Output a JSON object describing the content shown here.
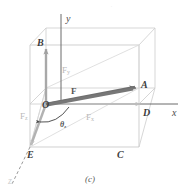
{
  "figure": {
    "caption": "(c)",
    "top_mark": "'",
    "axes": [
      {
        "name": "y-axis",
        "label": "y"
      },
      {
        "name": "x-axis",
        "label": "x"
      },
      {
        "name": "z-axis",
        "label": "z"
      }
    ],
    "vertices": [
      {
        "name": "O",
        "label": "O"
      },
      {
        "name": "A",
        "label": "A"
      },
      {
        "name": "B",
        "label": "B"
      },
      {
        "name": "C",
        "label": "C"
      },
      {
        "name": "D",
        "label": "D"
      },
      {
        "name": "E",
        "label": "E"
      }
    ],
    "vectors": [
      {
        "name": "resultant-force",
        "label": "F",
        "sub": ""
      },
      {
        "name": "component-x",
        "label": "F",
        "sub": "x"
      },
      {
        "name": "component-y",
        "label": "F",
        "sub": "y"
      },
      {
        "name": "component-z",
        "label": "F",
        "sub": "z"
      }
    ],
    "angle": {
      "name": "theta-z",
      "label": "θ",
      "sub": "z"
    },
    "colors": {
      "box_edge": "#c9c9c9",
      "resultant_arrow": "#6f6f6f",
      "component_arrow": "#a8a8a8",
      "faint_arrow": "#d2d2d2",
      "text_dark": "#3d3d3d",
      "text_light": "#b9b9b9",
      "background": "#ffffff"
    }
  }
}
